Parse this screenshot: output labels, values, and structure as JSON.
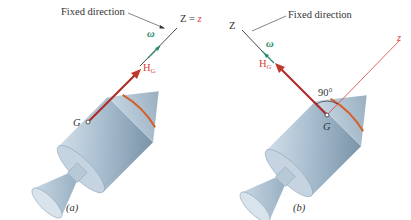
{
  "figure": {
    "panels": [
      {
        "id": "a",
        "caption": "(a)",
        "fixed_direction_label": "Fixed direction",
        "axis_label_Z": "Z",
        "axis_label_eq": " = ",
        "axis_label_z": "z",
        "omega_label": "ω",
        "H_label": "H",
        "H_sub": "G",
        "center_label": "G"
      },
      {
        "id": "b",
        "caption": "(b)",
        "fixed_direction_label": "Fixed direction",
        "axis_label_Z": "Z",
        "axis_label_z": "z",
        "omega_label": "ω",
        "H_label": "H",
        "H_sub": "G",
        "center_label": "G",
        "angle_label": "90°"
      }
    ],
    "colors": {
      "body_fill": "#9fb6c8",
      "body_light": "#cfdbe5",
      "body_dark": "#6f889d",
      "red_axis": "#d9413a",
      "H_arrow": "#b02a2a",
      "band": "#d2602a",
      "omega_green": "#2a8a6a",
      "line_dark": "#333333"
    }
  }
}
